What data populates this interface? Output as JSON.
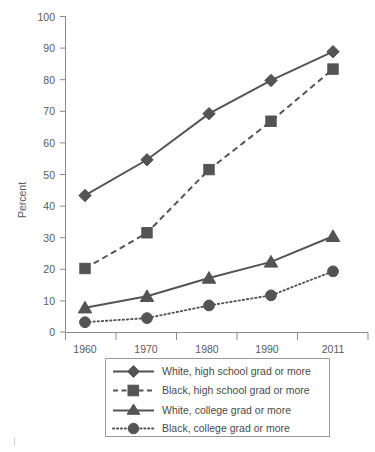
{
  "chart_data": {
    "type": "line",
    "title": "",
    "xlabel": "",
    "ylabel": "Percent",
    "categories": [
      "1960",
      "1970",
      "1980",
      "1990",
      "2011"
    ],
    "ylim": [
      0,
      100
    ],
    "yticks": [
      0,
      10,
      20,
      30,
      40,
      50,
      60,
      70,
      80,
      90,
      100
    ],
    "grid": false,
    "legend_position": "bottom",
    "series": [
      {
        "name": "White, high school grad or more",
        "marker": "diamond",
        "line_style": "solid",
        "color": "#545454",
        "values": [
          43.2,
          54.5,
          69.1,
          79.6,
          88.7
        ]
      },
      {
        "name": "Black, high school grad or more",
        "marker": "square",
        "line_style": "dashed",
        "color": "#545454",
        "values": [
          20.1,
          31.4,
          51.4,
          66.7,
          83.2
        ]
      },
      {
        "name": "White, college grad or more",
        "marker": "triangle",
        "line_style": "solid",
        "color": "#545454",
        "values": [
          7.7,
          11.3,
          17.1,
          22.2,
          30.3
        ]
      },
      {
        "name": "Black, college grad or more",
        "marker": "circle",
        "line_style": "dotted",
        "color": "#545454",
        "values": [
          3.1,
          4.4,
          8.4,
          11.6,
          19.2
        ]
      }
    ]
  },
  "axis": {
    "y_tick_labels": [
      "100",
      "90",
      "80",
      "70",
      "60",
      "50",
      "40",
      "30",
      "20",
      "10",
      "0"
    ],
    "x_tick_labels": [
      "1960",
      "1970",
      "1980",
      "1990",
      "2011"
    ],
    "y_title": "Percent"
  },
  "legend": {
    "entries": [
      {
        "label": "White, high school grad or more"
      },
      {
        "label": "Black, high school grad or more"
      },
      {
        "label": "White, college grad or more"
      },
      {
        "label": "Black, college grad or more"
      }
    ]
  }
}
